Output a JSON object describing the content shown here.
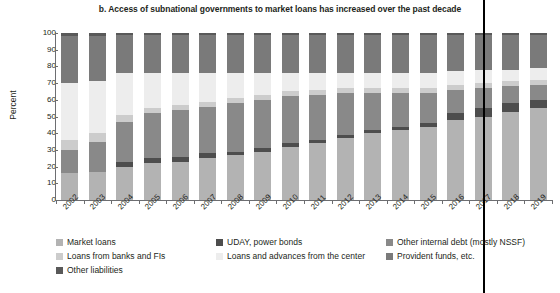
{
  "chart_data": {
    "type": "bar",
    "subtype": "stacked-bar-100",
    "title": "b. Access of subnational governments to market loans has increased over the past decade",
    "xlabel": "",
    "ylabel": "Percent",
    "ylim": [
      0,
      100
    ],
    "ytick_labels": [
      "0",
      "10",
      "20",
      "30",
      "40",
      "50",
      "60",
      "70",
      "80",
      "90",
      "100"
    ],
    "ytick_values": [
      0,
      10,
      20,
      30,
      40,
      50,
      60,
      70,
      80,
      90,
      100
    ],
    "grid": false,
    "legend_position": "bottom",
    "categories": [
      "2002",
      "2003",
      "2004",
      "2005",
      "2006",
      "2007",
      "2008",
      "2009",
      "2010",
      "2011",
      "2012",
      "2013",
      "2014",
      "2015",
      "2016",
      "2017",
      "2018",
      "2019"
    ],
    "series": [
      {
        "name": "Market loans",
        "color": "#b3b3b3",
        "values": [
          16,
          17,
          20,
          22,
          23,
          25,
          27,
          29,
          32,
          34,
          37,
          40,
          42,
          44,
          48,
          50,
          53,
          55
        ]
      },
      {
        "name": "UDAY, power bonds",
        "color": "#4d4d4d",
        "values": [
          0,
          0,
          3,
          3,
          3,
          3,
          2,
          2,
          2,
          2,
          2,
          2,
          2,
          2,
          4,
          5,
          5,
          5
        ]
      },
      {
        "name": "Other internal debt (mostly NSSF)",
        "color": "#898989",
        "values": [
          14,
          18,
          24,
          27,
          28,
          28,
          29,
          29,
          28,
          27,
          25,
          22,
          20,
          18,
          14,
          12,
          10,
          9
        ]
      },
      {
        "name": "Loans from banks and FIs",
        "color": "#cccccc",
        "values": [
          6,
          5,
          4,
          3,
          3,
          3,
          3,
          3,
          3,
          3,
          3,
          3,
          3,
          3,
          3,
          3,
          3,
          3
        ]
      },
      {
        "name": "Loans and advances from the center",
        "color": "#ededed",
        "values": [
          34,
          31,
          25,
          21,
          19,
          17,
          15,
          13,
          11,
          10,
          9,
          9,
          9,
          9,
          8,
          8,
          7,
          7
        ]
      },
      {
        "name": "Provident funds, etc.",
        "color": "#7a7a7a",
        "values": [
          28,
          27,
          23,
          23,
          23,
          23,
          23,
          23,
          23,
          23,
          23,
          23,
          23,
          23,
          22,
          21,
          21,
          20
        ]
      },
      {
        "name": "Other liabilities",
        "color": "#595959",
        "values": [
          2,
          2,
          1,
          1,
          1,
          1,
          1,
          1,
          1,
          1,
          1,
          1,
          1,
          1,
          1,
          1,
          1,
          1
        ]
      }
    ],
    "annotation_line": {
      "at_category": "2017",
      "color": "#000000",
      "label": ""
    }
  },
  "legend": {
    "items": [
      {
        "label": "Market loans",
        "color": "#b3b3b3"
      },
      {
        "label": "UDAY, power bonds",
        "color": "#4d4d4d"
      },
      {
        "label": "Other internal debt (mostly NSSF)",
        "color": "#898989"
      },
      {
        "label": "Loans from banks and FIs",
        "color": "#cccccc"
      },
      {
        "label": "Loans and advances from the center",
        "color": "#ededed"
      },
      {
        "label": "Provident funds, etc.",
        "color": "#7a7a7a"
      },
      {
        "label": "Other liabilities",
        "color": "#595959"
      }
    ]
  }
}
